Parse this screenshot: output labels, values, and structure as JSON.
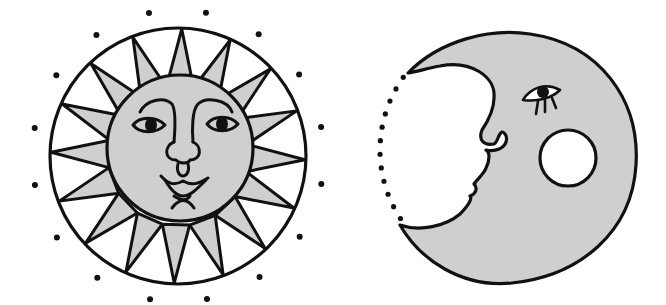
{
  "illustration": {
    "title": "Sun and Moon with faces",
    "colors": {
      "background": "#ffffff",
      "ink": "#111111",
      "fill": "#cfcfcf"
    },
    "sun": {
      "label": "Sun face",
      "ray_count": 16,
      "dot_count": 16
    },
    "moon": {
      "label": "Crescent moon face",
      "dotted_edge_dots": 12
    }
  }
}
